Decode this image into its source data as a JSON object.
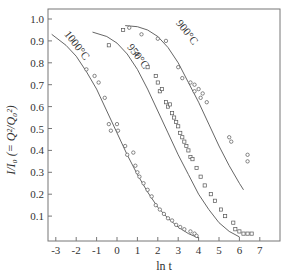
{
  "chart_data": {
    "type": "scatter",
    "title": "",
    "xlabel": "ln t",
    "ylabel": "I/I₀ (= Q²/Q₀²)",
    "xlim": [
      -3.4,
      7.9
    ],
    "ylim": [
      0,
      1.05
    ],
    "xticks": [
      -3,
      -2,
      -1,
      0,
      1,
      2,
      3,
      4,
      5,
      6,
      7
    ],
    "yticks": [
      0.1,
      0.2,
      0.3,
      0.4,
      0.5,
      0.6,
      0.7,
      0.8,
      0.9,
      1.0
    ],
    "ytick_labels": [
      "0.1",
      "0.2",
      "0.3",
      "0.4",
      "0.5",
      "0.6",
      "0.7",
      "0.8",
      "0.9",
      "1.0"
    ],
    "grid": false,
    "legend": "none (curves labeled inline)",
    "series": [
      {
        "name": "1000°C",
        "label_pos": [
          -2.1,
          0.87
        ],
        "curve": [
          [
            -3.2,
            0.93
          ],
          [
            -2.5,
            0.88
          ],
          [
            -2,
            0.83
          ],
          [
            -1.5,
            0.76
          ],
          [
            -1,
            0.68
          ],
          [
            -0.5,
            0.58
          ],
          [
            0,
            0.48
          ],
          [
            0.5,
            0.38
          ],
          [
            1,
            0.29
          ],
          [
            1.5,
            0.21
          ],
          [
            2,
            0.14
          ],
          [
            2.5,
            0.09
          ],
          [
            3,
            0.05
          ],
          [
            3.5,
            0.02
          ],
          [
            4,
            0.0
          ]
        ],
        "points": [
          [
            -1.5,
            0.77
          ],
          [
            -1.1,
            0.74
          ],
          [
            -0.9,
            0.71
          ],
          [
            -0.6,
            0.64
          ],
          [
            -0.4,
            0.52
          ],
          [
            -0.3,
            0.49
          ],
          [
            0,
            0.52
          ],
          [
            0.05,
            0.49
          ],
          [
            0.4,
            0.42
          ],
          [
            0.5,
            0.38
          ],
          [
            0.8,
            0.39
          ],
          [
            0.9,
            0.33
          ],
          [
            1.0,
            0.3
          ],
          [
            1.1,
            0.28
          ],
          [
            1.3,
            0.25
          ],
          [
            1.5,
            0.22
          ],
          [
            1.7,
            0.19
          ],
          [
            1.9,
            0.15
          ],
          [
            2.1,
            0.13
          ],
          [
            2.3,
            0.11
          ],
          [
            2.5,
            0.09
          ],
          [
            2.7,
            0.08
          ],
          [
            2.9,
            0.06
          ],
          [
            3.1,
            0.05
          ],
          [
            3.3,
            0.04
          ],
          [
            3.6,
            0.03
          ],
          [
            3.8,
            0.02
          ],
          [
            3.9,
            0.01
          ]
        ]
      },
      {
        "name": "950°C",
        "label_pos": [
          0.9,
          0.82
        ],
        "curve": [
          [
            -1.2,
            0.94
          ],
          [
            -0.5,
            0.92
          ],
          [
            0,
            0.89
          ],
          [
            0.5,
            0.84
          ],
          [
            1,
            0.77
          ],
          [
            1.5,
            0.68
          ],
          [
            2,
            0.58
          ],
          [
            2.5,
            0.48
          ],
          [
            3,
            0.38
          ],
          [
            3.5,
            0.29
          ],
          [
            4,
            0.2
          ],
          [
            4.5,
            0.13
          ],
          [
            5,
            0.07
          ],
          [
            5.5,
            0.03
          ],
          [
            6,
            0.005
          ]
        ],
        "points": [
          [
            -0.4,
            0.88
          ],
          [
            0.3,
            0.95
          ],
          [
            1.0,
            0.84
          ],
          [
            1.5,
            0.78
          ],
          [
            1.9,
            0.74
          ],
          [
            2.0,
            0.71
          ],
          [
            2.1,
            0.67
          ],
          [
            2.2,
            0.68
          ],
          [
            2.4,
            0.62
          ],
          [
            2.5,
            0.6
          ],
          [
            2.6,
            0.61
          ],
          [
            2.7,
            0.57
          ],
          [
            2.8,
            0.55
          ],
          [
            2.9,
            0.53
          ],
          [
            3.0,
            0.51
          ],
          [
            3.1,
            0.48
          ],
          [
            3.2,
            0.46
          ],
          [
            3.3,
            0.44
          ],
          [
            3.4,
            0.42
          ],
          [
            3.5,
            0.4
          ],
          [
            3.6,
            0.37
          ],
          [
            3.7,
            0.36
          ],
          [
            3.9,
            0.32
          ],
          [
            4.1,
            0.28
          ],
          [
            4.3,
            0.24
          ],
          [
            4.6,
            0.2
          ],
          [
            4.8,
            0.17
          ],
          [
            5.1,
            0.13
          ],
          [
            5.3,
            0.1
          ],
          [
            5.7,
            0.07
          ],
          [
            5.8,
            0.04
          ],
          [
            6.0,
            0.03
          ],
          [
            6.2,
            0.02
          ],
          [
            6.4,
            0.02
          ],
          [
            6.6,
            0.02
          ]
        ]
      },
      {
        "name": "900°C",
        "label_pos": [
          3.3,
          0.93
        ],
        "curve": [
          [
            0.4,
            0.97
          ],
          [
            1,
            0.965
          ],
          [
            1.5,
            0.95
          ],
          [
            2,
            0.92
          ],
          [
            2.5,
            0.87
          ],
          [
            3,
            0.8
          ],
          [
            3.5,
            0.71
          ],
          [
            4,
            0.62
          ],
          [
            4.5,
            0.52
          ],
          [
            5,
            0.42
          ],
          [
            5.5,
            0.33
          ],
          [
            6,
            0.25
          ],
          [
            6.2,
            0.22
          ]
        ],
        "points": [
          [
            0.6,
            0.96
          ],
          [
            1.2,
            0.93
          ],
          [
            2.0,
            0.91
          ],
          [
            2.4,
            0.9
          ],
          [
            3.0,
            0.78
          ],
          [
            3.2,
            0.73
          ],
          [
            3.6,
            0.71
          ],
          [
            3.8,
            0.7
          ],
          [
            4.0,
            0.68
          ],
          [
            4.2,
            0.66
          ],
          [
            4.1,
            0.64
          ],
          [
            4.4,
            0.62
          ],
          [
            3.8,
            0.67
          ],
          [
            5.5,
            0.46
          ],
          [
            5.6,
            0.44
          ],
          [
            6.4,
            0.38
          ],
          [
            6.4,
            0.35
          ]
        ]
      }
    ]
  }
}
